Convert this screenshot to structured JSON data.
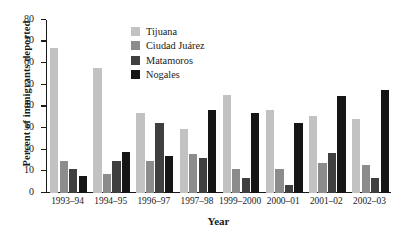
{
  "chart_data": {
    "type": "bar",
    "title": "",
    "xlabel": "Year",
    "ylabel": "Percent of immigrants deported",
    "ylim": [
      0,
      80
    ],
    "ytick_step": 10,
    "grid": false,
    "legend_position": "top-center",
    "categories": [
      "1993–94",
      "1994–95",
      "1996–97",
      "1997–98",
      "1999–2000",
      "2000–01",
      "2001–02",
      "2002–03"
    ],
    "yticks": [
      "0",
      "10",
      "20",
      "30",
      "40",
      "50",
      "60",
      "70",
      "80"
    ],
    "series": [
      {
        "name": "Tijuana",
        "color": "#c2c2c2",
        "values": [
          67,
          58,
          37,
          29.5,
          45.5,
          38.5,
          35.5,
          34
        ]
      },
      {
        "name": "Ciudad Juárez",
        "color": "#8c8c8c",
        "values": [
          15,
          9,
          15,
          18,
          11,
          11,
          14,
          13
        ]
      },
      {
        "name": "Matamoros",
        "color": "#3f3f3f",
        "values": [
          11,
          15,
          32.5,
          16,
          7,
          3.5,
          18.5,
          7
        ]
      },
      {
        "name": "Nogales",
        "color": "#151515",
        "values": [
          8,
          19,
          17,
          38.5,
          37,
          32.5,
          45,
          47.5
        ]
      }
    ]
  },
  "legend": {
    "items": [
      {
        "label": "Tijuana",
        "color": "#c2c2c2"
      },
      {
        "label": "Ciudad Juárez",
        "color": "#8c8c8c"
      },
      {
        "label": "Matamoros",
        "color": "#3f3f3f"
      },
      {
        "label": "Nogales",
        "color": "#151515"
      }
    ]
  },
  "axes": {
    "y_title": "Percent of immigrants deported",
    "x_title": "Year"
  }
}
